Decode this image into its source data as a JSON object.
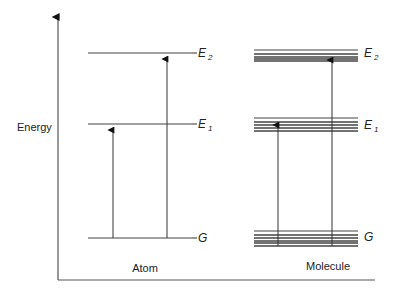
{
  "diagram": {
    "type": "energy-level-diagram",
    "axis": {
      "ylabel": "Energy",
      "color": "#555555",
      "origin": [
        58,
        280
      ],
      "y_top": 17,
      "x_right": 375
    },
    "columns": [
      {
        "id": "atom",
        "label": "Atom",
        "label_pos": [
          145,
          272
        ],
        "x_start": 88,
        "x_end": 192,
        "levels": [
          {
            "name": "E",
            "sub": "2",
            "y": [
              53
            ],
            "label_y": 57
          },
          {
            "name": "E",
            "sub": "1",
            "y": [
              124
            ],
            "label_y": 128
          },
          {
            "name": "G",
            "sub": "",
            "y": [
              238
            ],
            "label_y": 242
          }
        ],
        "transitions": [
          {
            "x": 113,
            "from": 238,
            "to": 126
          },
          {
            "x": 167,
            "from": 238,
            "to": 55
          }
        ]
      },
      {
        "id": "molecule",
        "label": "Molecule",
        "label_pos": [
          328,
          270
        ],
        "x_start": 254,
        "x_end": 358,
        "levels": [
          {
            "name": "E",
            "sub": "2",
            "y": [
              50,
              54,
              57,
              59,
              61
            ],
            "label_y": 57
          },
          {
            "name": "E",
            "sub": "1",
            "y": [
              118,
              122,
              125,
              128,
              131
            ],
            "label_y": 129
          },
          {
            "name": "G",
            "sub": "",
            "y": [
              231,
              235,
              238,
              241,
              243,
              246
            ],
            "label_y": 241
          }
        ],
        "transitions": [
          {
            "x": 278,
            "from": 246,
            "to": 121
          },
          {
            "x": 332,
            "from": 246,
            "to": 56
          }
        ]
      }
    ],
    "line_color": "#333333",
    "level_color": "#444444"
  }
}
